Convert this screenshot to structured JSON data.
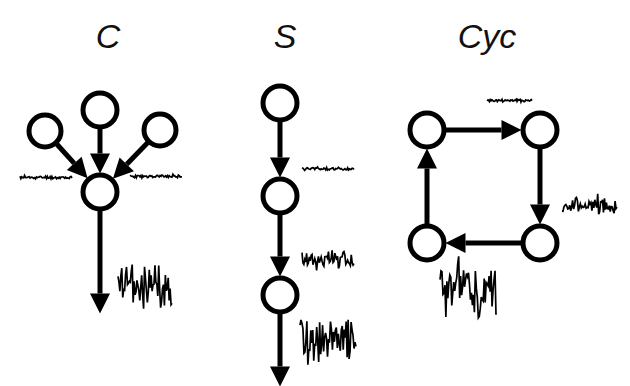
{
  "figure": {
    "background_color": "#ffffff",
    "ink_color": "#000000",
    "width": 630,
    "height": 386,
    "caption_text": ""
  },
  "panels": [
    {
      "id": "common-effect",
      "label": "C",
      "label_x": 108,
      "label_y": 48,
      "label_size": 34,
      "nodes": [
        {
          "name": "node-top-center",
          "cx": 100,
          "cy": 110,
          "r": 17
        },
        {
          "name": "node-left",
          "cx": 45,
          "cy": 131,
          "r": 16
        },
        {
          "name": "node-right",
          "cx": 160,
          "cy": 130,
          "r": 16
        },
        {
          "name": "node-bottom",
          "cx": 100,
          "cy": 192,
          "r": 17
        }
      ],
      "edges": [
        {
          "name": "edge-top-to-bottom",
          "from": "node-top-center",
          "to": "node-bottom"
        },
        {
          "name": "edge-left-to-bottom",
          "from": "node-left",
          "to": "node-bottom"
        },
        {
          "name": "edge-right-to-bottom",
          "from": "node-right",
          "to": "node-bottom"
        },
        {
          "name": "edge-bottom-output",
          "from": "node-bottom",
          "to": "output"
        }
      ],
      "traces": [
        {
          "name": "noise-trace-left",
          "x": 20,
          "y": 172,
          "w": 52,
          "h": 11,
          "amplitude": "small",
          "seed": 11
        },
        {
          "name": "noise-trace-right",
          "x": 130,
          "y": 171,
          "w": 52,
          "h": 11,
          "amplitude": "small",
          "seed": 23
        },
        {
          "name": "noise-trace-output",
          "x": 118,
          "y": 262,
          "w": 54,
          "h": 48,
          "amplitude": "large",
          "seed": 37
        }
      ]
    },
    {
      "id": "serial-chain",
      "label": "S",
      "label_x": 285,
      "label_y": 48,
      "label_size": 34,
      "nodes": [
        {
          "name": "node-1",
          "cx": 280,
          "cy": 103,
          "r": 17
        },
        {
          "name": "node-2",
          "cx": 280,
          "cy": 196,
          "r": 17
        },
        {
          "name": "node-3",
          "cx": 280,
          "cy": 295,
          "r": 17
        }
      ],
      "edges": [
        {
          "name": "edge-1-to-2",
          "from": "node-1",
          "to": "node-2"
        },
        {
          "name": "edge-2-to-3",
          "from": "node-2",
          "to": "node-3"
        },
        {
          "name": "edge-3-output",
          "from": "node-3",
          "to": "output"
        }
      ],
      "traces": [
        {
          "name": "noise-trace-1",
          "x": 302,
          "y": 163,
          "w": 52,
          "h": 12,
          "amplitude": "small",
          "seed": 5
        },
        {
          "name": "noise-trace-2",
          "x": 302,
          "y": 246,
          "w": 52,
          "h": 27,
          "amplitude": "medium",
          "seed": 17
        },
        {
          "name": "noise-trace-3",
          "x": 300,
          "y": 318,
          "w": 56,
          "h": 48,
          "amplitude": "large",
          "seed": 29
        }
      ]
    },
    {
      "id": "cyclic",
      "label": "Cyc",
      "label_x": 487,
      "label_y": 48,
      "label_size": 34,
      "nodes": [
        {
          "name": "node-top-left",
          "cx": 427,
          "cy": 130,
          "r": 17
        },
        {
          "name": "node-top-right",
          "cx": 540,
          "cy": 130,
          "r": 17
        },
        {
          "name": "node-bottom-right",
          "cx": 540,
          "cy": 243,
          "r": 17
        },
        {
          "name": "node-bottom-left",
          "cx": 427,
          "cy": 243,
          "r": 17
        }
      ],
      "edges": [
        {
          "name": "edge-tl-to-tr",
          "from": "node-top-left",
          "to": "node-top-right"
        },
        {
          "name": "edge-tr-to-br",
          "from": "node-top-right",
          "to": "node-bottom-right"
        },
        {
          "name": "edge-br-to-bl",
          "from": "node-bottom-right",
          "to": "node-bottom-left"
        },
        {
          "name": "edge-bl-to-tl",
          "from": "node-bottom-left",
          "to": "node-top-left"
        }
      ],
      "traces": [
        {
          "name": "noise-trace-top",
          "x": 487,
          "y": 95,
          "w": 45,
          "h": 11,
          "amplitude": "small",
          "seed": 41
        },
        {
          "name": "noise-trace-right",
          "x": 562,
          "y": 192,
          "w": 55,
          "h": 28,
          "amplitude": "medium",
          "seed": 53
        },
        {
          "name": "noise-trace-bottom-left",
          "x": 440,
          "y": 262,
          "w": 56,
          "h": 58,
          "amplitude": "large",
          "seed": 61
        }
      ]
    }
  ],
  "arrow_head": {
    "length": 20,
    "half_width": 10
  },
  "amplitude_scale": {
    "small": 0.3,
    "medium": 0.62,
    "large": 1.0
  }
}
